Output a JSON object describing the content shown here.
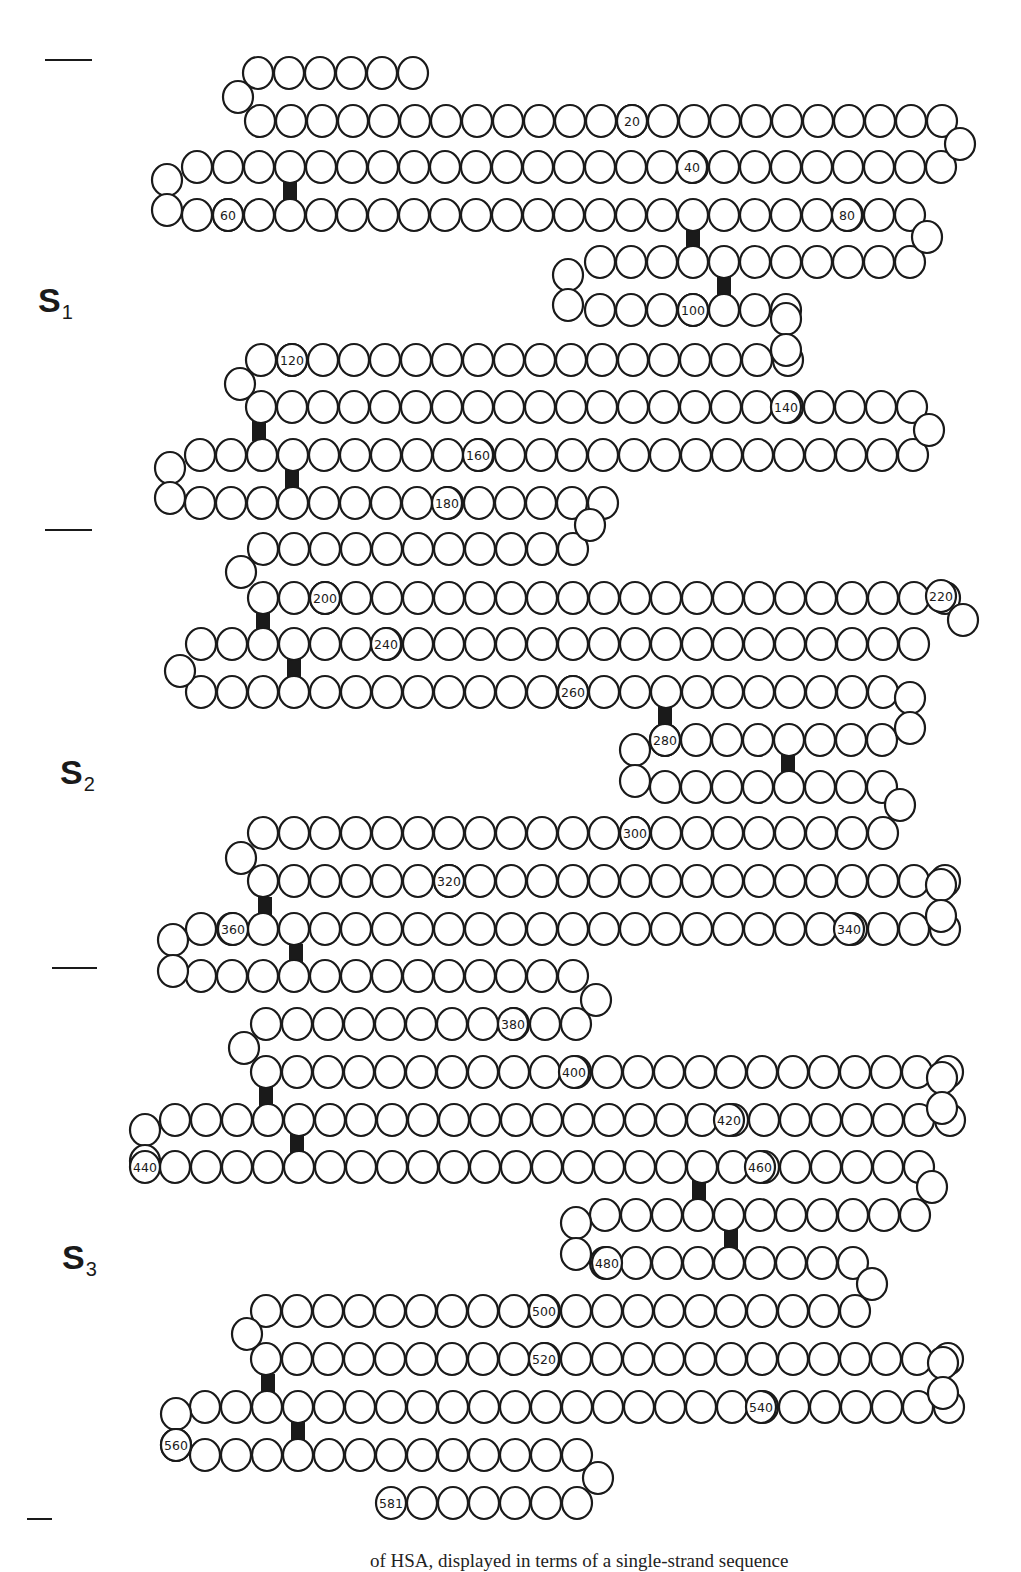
{
  "figure": {
    "total_residues": 581,
    "colors": {
      "stroke": "#1a1a1a",
      "fill": "#ffffff",
      "disulfide": "#1a1a1a"
    },
    "circle_radius": 15,
    "pitch": 31
  },
  "domains": [
    {
      "id": "S1",
      "letter": "S",
      "sub": "1",
      "x": 38,
      "y": 283
    },
    {
      "id": "S2",
      "letter": "S",
      "sub": "2",
      "x": 60,
      "y": 755
    },
    {
      "id": "S3",
      "letter": "S",
      "sub": "3",
      "x": 62,
      "y": 1240
    }
  ],
  "separators": [
    {
      "x1": 45,
      "x2": 92,
      "y": 60
    },
    {
      "x1": 45,
      "x2": 92,
      "y": 530
    },
    {
      "x1": 52,
      "x2": 97,
      "y": 968
    },
    {
      "x1": 27,
      "x2": 52,
      "y": 1519
    }
  ],
  "rows": [
    {
      "x": 258,
      "y": 73,
      "n": 6
    },
    {
      "x": 260,
      "y": 121,
      "n": 23
    },
    {
      "x": 197,
      "y": 167,
      "n": 25
    },
    {
      "x": 197,
      "y": 215,
      "n": 24
    },
    {
      "x": 600,
      "y": 262,
      "n": 11
    },
    {
      "x": 600,
      "y": 310,
      "n": 7
    },
    {
      "x": 261,
      "y": 360,
      "n": 18
    },
    {
      "x": 261,
      "y": 407,
      "n": 22
    },
    {
      "x": 200,
      "y": 455,
      "n": 24
    },
    {
      "x": 200,
      "y": 503,
      "n": 14
    },
    {
      "x": 263,
      "y": 549,
      "n": 11
    },
    {
      "x": 263,
      "y": 598,
      "n": 23
    },
    {
      "x": 201,
      "y": 644,
      "n": 24
    },
    {
      "x": 201,
      "y": 692,
      "n": 23
    },
    {
      "x": 665,
      "y": 740,
      "n": 8
    },
    {
      "x": 665,
      "y": 787,
      "n": 8
    },
    {
      "x": 263,
      "y": 833,
      "n": 21
    },
    {
      "x": 263,
      "y": 881,
      "n": 23
    },
    {
      "x": 201,
      "y": 929,
      "n": 25
    },
    {
      "x": 201,
      "y": 976,
      "n": 13
    },
    {
      "x": 266,
      "y": 1024,
      "n": 11
    },
    {
      "x": 266,
      "y": 1072,
      "n": 23
    },
    {
      "x": 175,
      "y": 1120,
      "n": 26
    },
    {
      "x": 175,
      "y": 1167,
      "n": 25
    },
    {
      "x": 605,
      "y": 1215,
      "n": 11
    },
    {
      "x": 605,
      "y": 1263,
      "n": 9
    },
    {
      "x": 266,
      "y": 1311,
      "n": 20
    },
    {
      "x": 266,
      "y": 1359,
      "n": 23
    },
    {
      "x": 205,
      "y": 1407,
      "n": 25
    },
    {
      "x": 205,
      "y": 1455,
      "n": 13
    },
    {
      "x": 422,
      "y": 1503,
      "n": 6
    }
  ],
  "turns": [
    {
      "x": 238,
      "y": 97
    },
    {
      "x": 960,
      "y": 144
    },
    {
      "x": 167,
      "y": 180
    },
    {
      "x": 167,
      "y": 210
    },
    {
      "x": 927,
      "y": 237
    },
    {
      "x": 568,
      "y": 275
    },
    {
      "x": 568,
      "y": 305
    },
    {
      "x": 786,
      "y": 319
    },
    {
      "x": 786,
      "y": 350
    },
    {
      "x": 240,
      "y": 384
    },
    {
      "x": 929,
      "y": 430
    },
    {
      "x": 170,
      "y": 468
    },
    {
      "x": 170,
      "y": 498
    },
    {
      "x": 590,
      "y": 525
    },
    {
      "x": 241,
      "y": 572
    },
    {
      "x": 963,
      "y": 620
    },
    {
      "x": 180,
      "y": 671
    },
    {
      "x": 910,
      "y": 698
    },
    {
      "x": 910,
      "y": 728
    },
    {
      "x": 635,
      "y": 750
    },
    {
      "x": 635,
      "y": 781
    },
    {
      "x": 900,
      "y": 805
    },
    {
      "x": 241,
      "y": 858
    },
    {
      "x": 941,
      "y": 885
    },
    {
      "x": 941,
      "y": 916
    },
    {
      "x": 173,
      "y": 940
    },
    {
      "x": 173,
      "y": 971
    },
    {
      "x": 596,
      "y": 1000
    },
    {
      "x": 244,
      "y": 1048
    },
    {
      "x": 942,
      "y": 1078
    },
    {
      "x": 942,
      "y": 1108
    },
    {
      "x": 145,
      "y": 1130
    },
    {
      "x": 145,
      "y": 1161
    },
    {
      "x": 932,
      "y": 1187
    },
    {
      "x": 576,
      "y": 1223
    },
    {
      "x": 576,
      "y": 1254
    },
    {
      "x": 872,
      "y": 1284
    },
    {
      "x": 247,
      "y": 1334
    },
    {
      "x": 943,
      "y": 1363
    },
    {
      "x": 943,
      "y": 1393
    },
    {
      "x": 176,
      "y": 1414
    },
    {
      "x": 176,
      "y": 1445
    },
    {
      "x": 598,
      "y": 1478
    }
  ],
  "disulfides": [
    {
      "x": 290,
      "y": 191
    },
    {
      "x": 693,
      "y": 238
    },
    {
      "x": 724,
      "y": 286
    },
    {
      "x": 259,
      "y": 431
    },
    {
      "x": 292,
      "y": 479
    },
    {
      "x": 263,
      "y": 621
    },
    {
      "x": 294,
      "y": 668
    },
    {
      "x": 665,
      "y": 715
    },
    {
      "x": 788,
      "y": 762
    },
    {
      "x": 265,
      "y": 907
    },
    {
      "x": 296,
      "y": 954
    },
    {
      "x": 266,
      "y": 1096
    },
    {
      "x": 297,
      "y": 1144
    },
    {
      "x": 699,
      "y": 1190
    },
    {
      "x": 731,
      "y": 1239
    },
    {
      "x": 268,
      "y": 1384
    },
    {
      "x": 298,
      "y": 1431
    }
  ],
  "labels": [
    {
      "text": "20",
      "x": 632,
      "y": 121
    },
    {
      "text": "40",
      "x": 692,
      "y": 167
    },
    {
      "text": "60",
      "x": 228,
      "y": 215
    },
    {
      "text": "80",
      "x": 847,
      "y": 215
    },
    {
      "text": "100",
      "x": 693,
      "y": 310
    },
    {
      "text": "120",
      "x": 292,
      "y": 360
    },
    {
      "text": "140",
      "x": 786,
      "y": 407
    },
    {
      "text": "160",
      "x": 478,
      "y": 455
    },
    {
      "text": "180",
      "x": 447,
      "y": 503
    },
    {
      "text": "200",
      "x": 325,
      "y": 598
    },
    {
      "text": "220",
      "x": 941,
      "y": 596
    },
    {
      "text": "240",
      "x": 386,
      "y": 644
    },
    {
      "text": "260",
      "x": 573,
      "y": 692
    },
    {
      "text": "280",
      "x": 665,
      "y": 740
    },
    {
      "text": "300",
      "x": 635,
      "y": 833
    },
    {
      "text": "320",
      "x": 449,
      "y": 881
    },
    {
      "text": "340",
      "x": 849,
      "y": 929
    },
    {
      "text": "360",
      "x": 233,
      "y": 929
    },
    {
      "text": "380",
      "x": 513,
      "y": 1024
    },
    {
      "text": "400",
      "x": 574,
      "y": 1072
    },
    {
      "text": "420",
      "x": 729,
      "y": 1120
    },
    {
      "text": "440",
      "x": 145,
      "y": 1167
    },
    {
      "text": "460",
      "x": 760,
      "y": 1167
    },
    {
      "text": "480",
      "x": 607,
      "y": 1263
    },
    {
      "text": "500",
      "x": 544,
      "y": 1311
    },
    {
      "text": "520",
      "x": 544,
      "y": 1359
    },
    {
      "text": "540",
      "x": 761,
      "y": 1407
    },
    {
      "text": "560",
      "x": 176,
      "y": 1445
    },
    {
      "text": "581",
      "x": 391,
      "y": 1503
    }
  ],
  "caption": {
    "text": "of HSA, displayed in terms of a single-strand sequence"
  }
}
